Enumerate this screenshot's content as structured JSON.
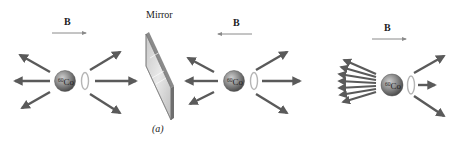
{
  "figure": {
    "panels": [
      {
        "id": "left",
        "field_label": "B",
        "field_direction": "right",
        "nucleus_label": "Co",
        "nucleus_mass_number": "60",
        "emission": "symmetric"
      },
      {
        "id": "mirror",
        "label": "Mirror",
        "caption": "(a)"
      },
      {
        "id": "middle",
        "field_label": "B",
        "field_direction": "left",
        "nucleus_label": "Co",
        "nucleus_mass_number": "60",
        "emission": "symmetric"
      },
      {
        "id": "right",
        "field_label": "B",
        "field_direction": "right",
        "nucleus_label": "Co",
        "nucleus_mass_number": "60",
        "emission": "asymmetric-backward"
      }
    ],
    "colors": {
      "arrow": "#5a5a5a",
      "field_arrow": "#8a8a8a",
      "sphere": "#7d7d7d",
      "spin_ring": "#b5b5b5",
      "mirror_face": "#d9d9d9",
      "mirror_edge": "#6e6e6e"
    }
  }
}
